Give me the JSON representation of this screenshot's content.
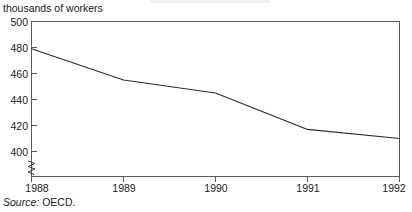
{
  "figure": {
    "axis_title": "thousands of workers",
    "source": {
      "label": "Source:",
      "value": "OECD."
    }
  },
  "chart_data": {
    "type": "line",
    "title": "",
    "subtitle": "",
    "xlabel": "",
    "ylabel": "thousands of workers",
    "categories": [
      "1988",
      "1989",
      "1990",
      "1991",
      "1992"
    ],
    "x": [
      1988,
      1989,
      1990,
      1991,
      1992
    ],
    "values": [
      479,
      455,
      445,
      417,
      410
    ],
    "series": [
      {
        "name": "Employment",
        "values": [
          479,
          455,
          445,
          417,
          410
        ]
      }
    ],
    "xlim": [
      1988,
      1992
    ],
    "ylim": [
      400,
      500
    ],
    "y_axis_broken_below": 400,
    "yticks": [
      400,
      420,
      440,
      460,
      480,
      500
    ],
    "ytick_labels": [
      "400",
      "420",
      "440",
      "460",
      "480",
      "500"
    ],
    "xticks": [
      1988,
      1989,
      1990,
      1991,
      1992
    ],
    "xtick_labels": [
      "1988",
      "1989",
      "1990",
      "1991",
      "1992"
    ],
    "grid": false,
    "legend": false,
    "legend_position": "none",
    "line_color": "#2b2b2b",
    "axis_color": "#5a5a5a",
    "background_color": "#ffffff",
    "annotations": []
  }
}
